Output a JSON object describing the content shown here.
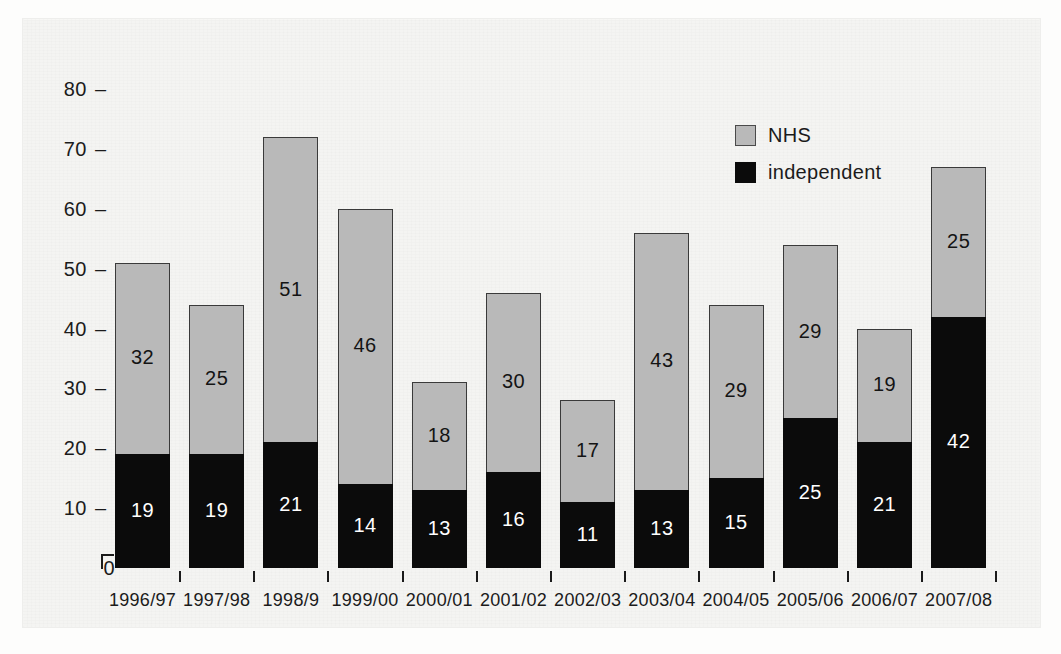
{
  "chart_data": {
    "type": "bar",
    "subtype": "stacked-column",
    "title": "",
    "xlabel": "",
    "ylabel": "",
    "ylim": [
      0,
      80
    ],
    "yticks": [
      0,
      10,
      20,
      30,
      40,
      50,
      60,
      70,
      80
    ],
    "ytick_labels": [
      "0",
      "10",
      "20",
      "30",
      "40",
      "50",
      "60",
      "70",
      "80"
    ],
    "grid": false,
    "legend_position": "top-right",
    "categories": [
      "1996/97",
      "1997/98",
      "1998/9",
      "1999/00",
      "2000/01",
      "2001/02",
      "2002/03",
      "2003/04",
      "2004/05",
      "2005/06",
      "2006/07",
      "2007/08"
    ],
    "series": [
      {
        "name": "independent",
        "color": "#0b0b0b",
        "values": [
          19,
          19,
          21,
          14,
          13,
          16,
          11,
          13,
          15,
          25,
          21,
          42
        ]
      },
      {
        "name": "NHS",
        "color": "#b9b9b9",
        "values": [
          32,
          25,
          51,
          46,
          18,
          30,
          17,
          43,
          29,
          29,
          19,
          25
        ]
      }
    ],
    "totals": [
      51,
      44,
      72,
      60,
      31,
      46,
      28,
      56,
      44,
      54,
      40,
      67
    ],
    "stack_order": [
      "independent",
      "NHS"
    ]
  },
  "legend": {
    "items": [
      {
        "label": "NHS",
        "swatch": "gray-square"
      },
      {
        "label": "independent",
        "swatch": "black-square"
      }
    ]
  },
  "colors": {
    "nhs": "#b9b9b9",
    "independent": "#0b0b0b",
    "axis": "#1b1b1b",
    "background": "#f4f4f2"
  }
}
